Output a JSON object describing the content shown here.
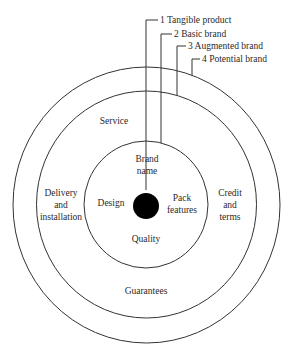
{
  "diagram": {
    "type": "concentric-rings",
    "title_levels": [
      {
        "number": "1",
        "label": "1 Tangible product"
      },
      {
        "number": "2",
        "label": "2 Basic brand"
      },
      {
        "number": "3",
        "label": "3 Augmented brand"
      },
      {
        "number": "4",
        "label": "4 Potential brand"
      }
    ],
    "core": {
      "label_line1": "Brand",
      "label_line2": "name"
    },
    "inner_ring": {
      "design": "Design",
      "pack_line1": "Pack",
      "pack_line2": "features",
      "quality": "Quality"
    },
    "augmented_ring": {
      "service": "Service",
      "delivery_line1": "Delivery",
      "delivery_line2": "and",
      "delivery_line3": "installation",
      "credit_line1": "Credit",
      "credit_line2": "and",
      "credit_line3": "terms",
      "guarantees": "Guarantees"
    },
    "colors": {
      "stroke": "#333333",
      "core_fill": "#000000",
      "text": "#2a2a2a",
      "background": "#ffffff"
    }
  }
}
